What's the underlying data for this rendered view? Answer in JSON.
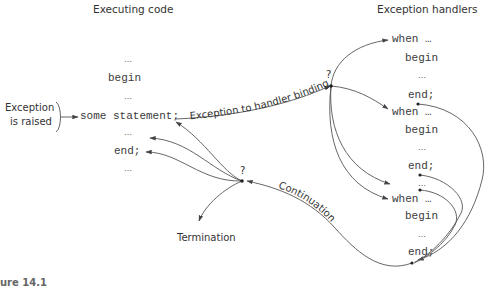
{
  "titles": {
    "left": "Executing code",
    "right": "Exception handlers"
  },
  "executing_code": {
    "lines": [
      "…",
      "begin",
      "…",
      "some statement;",
      "…",
      "end;",
      "…"
    ]
  },
  "exception_raised": {
    "line1": "Exception",
    "line2": "is raised"
  },
  "handlers": [
    {
      "when": "when …",
      "begin": "begin",
      "body": "…",
      "end": "end;"
    },
    {
      "when": "when …",
      "begin": "begin",
      "body": "…",
      "end": "end;"
    },
    {
      "separator": "…"
    },
    {
      "when": "when …",
      "begin": "begin",
      "body": "…",
      "end": "end;"
    }
  ],
  "labels": {
    "binding": "Exception to handler binding",
    "binding_q": "?",
    "continuation": "Continuation",
    "continuation_q": "?",
    "termination": "Termination"
  },
  "caption": "ure 14.1"
}
